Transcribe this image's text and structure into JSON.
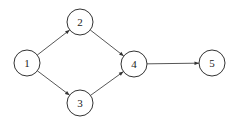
{
  "diagram": {
    "type": "directed-graph",
    "nodes": [
      {
        "id": "1",
        "label": "1",
        "cx": 27,
        "cy": 63
      },
      {
        "id": "2",
        "label": "2",
        "cx": 80,
        "cy": 22
      },
      {
        "id": "3",
        "label": "3",
        "cx": 80,
        "cy": 103
      },
      {
        "id": "4",
        "label": "4",
        "cx": 134,
        "cy": 64
      },
      {
        "id": "5",
        "label": "5",
        "cx": 212,
        "cy": 63
      }
    ],
    "edges": [
      {
        "from": "1",
        "to": "2"
      },
      {
        "from": "1",
        "to": "3"
      },
      {
        "from": "2",
        "to": "4"
      },
      {
        "from": "3",
        "to": "4"
      },
      {
        "from": "4",
        "to": "5"
      }
    ],
    "node_radius": 13,
    "colors": {
      "stroke": "#333333",
      "fill": "#ffffff",
      "text": "#222222"
    }
  }
}
